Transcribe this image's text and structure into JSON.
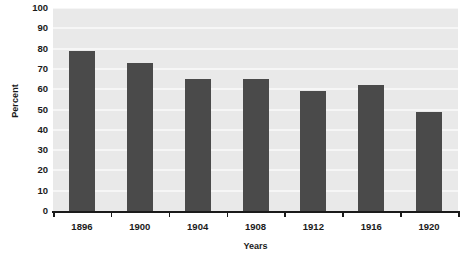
{
  "chart_data": {
    "type": "bar",
    "title": "",
    "subtitle": "",
    "xlabel": "Years",
    "ylabel": "Percent",
    "categories": [
      "1896",
      "1900",
      "1904",
      "1908",
      "1912",
      "1916",
      "1920"
    ],
    "values": [
      79,
      73,
      65,
      65,
      59,
      62,
      49
    ],
    "series": [
      {
        "name": "Percent",
        "values": [
          79,
          73,
          65,
          65,
          59,
          62,
          49
        ]
      }
    ],
    "ylim": [
      0,
      100
    ],
    "ytick_step": 10,
    "ytick_labels": [
      "100",
      "90",
      "80",
      "70",
      "60",
      "50",
      "40",
      "30",
      "20",
      "10",
      "0"
    ],
    "ytick_values": [
      100,
      90,
      80,
      70,
      60,
      50,
      40,
      30,
      20,
      10,
      0
    ],
    "grid": true,
    "grid_orientation": "horizontal",
    "legend": false,
    "legend_position": "none",
    "bar_color": "#4a4a4a",
    "plot_background": "#e9e9e9",
    "gridline_color": "#f6f6f6",
    "axis_color": "#1a1a1a",
    "page_background": "#ffffff"
  }
}
